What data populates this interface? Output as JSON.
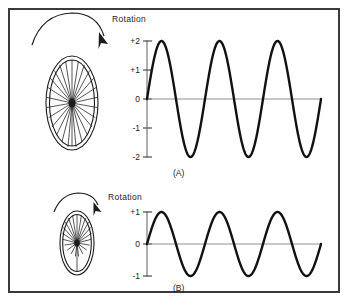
{
  "figure": {
    "frame_color": "#3a3a3c",
    "background": "#ffffff",
    "wave_color": "#111111",
    "axis_color": "#8e8e90"
  },
  "panels": [
    {
      "id": "A",
      "caption": "(A)",
      "rotation_label": "Rotation",
      "wheel": {
        "name": "large-wheel",
        "spoke_count": 22,
        "rim_count": 2
      },
      "axis": {
        "tick_labels": [
          "+2",
          "+1",
          "0",
          "-1",
          "-2"
        ],
        "tick_values": [
          2,
          1,
          0,
          -1,
          -2
        ]
      }
    },
    {
      "id": "B",
      "caption": "(B)",
      "rotation_label": "Rotation",
      "wheel": {
        "name": "small-wheel",
        "spoke_count": 20,
        "rim_count": 2
      },
      "axis": {
        "tick_labels": [
          "+1",
          "0",
          "-1"
        ],
        "tick_values": [
          1,
          0,
          -1
        ]
      }
    }
  ],
  "chart_data": [
    {
      "type": "line",
      "id": "waveform-A",
      "title": "(A)",
      "xlabel": "",
      "ylabel": "",
      "ylim": [
        -2,
        2
      ],
      "xlim": [
        0,
        3
      ],
      "grid": false,
      "legend": "none",
      "ytick_labels": [
        "+2",
        "+1",
        "0",
        "-1",
        "-2"
      ],
      "yticks": [
        2,
        1,
        0,
        -1,
        -2
      ],
      "series": [
        {
          "name": "large wheel output",
          "waveform": "sine",
          "amplitude": 2,
          "cycles": 3,
          "phase": 0,
          "x": [
            0,
            0.125,
            0.25,
            0.375,
            0.5,
            0.625,
            0.75,
            0.875,
            1,
            1.125,
            1.25,
            1.375,
            1.5,
            1.625,
            1.75,
            1.875,
            2,
            2.125,
            2.25,
            2.375,
            2.5,
            2.625,
            2.75,
            2.875,
            3
          ],
          "values": [
            0,
            1.41,
            2,
            1.41,
            0,
            -1.41,
            -2,
            -1.41,
            0,
            1.41,
            2,
            1.41,
            0,
            -1.41,
            -2,
            -1.41,
            0,
            1.41,
            2,
            1.41,
            0,
            -1.41,
            -2,
            -1.41,
            0
          ]
        }
      ]
    },
    {
      "type": "line",
      "id": "waveform-B",
      "title": "(B)",
      "xlabel": "",
      "ylabel": "",
      "ylim": [
        -1,
        1
      ],
      "xlim": [
        0,
        3
      ],
      "grid": false,
      "legend": "none",
      "ytick_labels": [
        "+1",
        "0",
        "-1"
      ],
      "yticks": [
        1,
        0,
        -1
      ],
      "series": [
        {
          "name": "small wheel output",
          "waveform": "sine",
          "amplitude": 1,
          "cycles": 3,
          "phase": 0,
          "x": [
            0,
            0.125,
            0.25,
            0.375,
            0.5,
            0.625,
            0.75,
            0.875,
            1,
            1.125,
            1.25,
            1.375,
            1.5,
            1.625,
            1.75,
            1.875,
            2,
            2.125,
            2.25,
            2.375,
            2.5,
            2.625,
            2.75,
            2.875,
            3
          ],
          "values": [
            0,
            0.71,
            1,
            0.71,
            0,
            -0.71,
            -1,
            -0.71,
            0,
            0.71,
            1,
            0.71,
            0,
            -0.71,
            -1,
            -0.71,
            0,
            0.71,
            1,
            0.71,
            0,
            -0.71,
            -1,
            -0.71,
            0
          ]
        }
      ]
    }
  ],
  "labels": {
    "rotation_a": "Rotation",
    "rotation_b": "Rotation",
    "caption_a": "(A)",
    "caption_b": "(B)",
    "a_tick_p2": "+2",
    "a_tick_p1": "+1",
    "a_tick_0": "0",
    "a_tick_m1": "-1",
    "a_tick_m2": "-2",
    "b_tick_p1": "+1",
    "b_tick_0": "0",
    "b_tick_m1": "-1"
  }
}
